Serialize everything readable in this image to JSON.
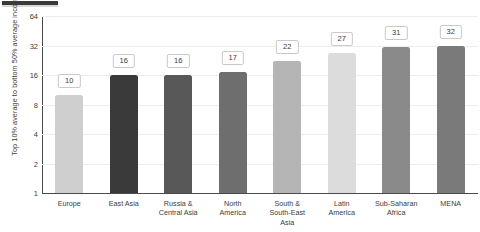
{
  "chart_data": {
    "type": "bar",
    "title": "",
    "subtitle": "",
    "xlabel": "",
    "ylabel": "Top 10% average to bottom 50% average income ratio",
    "categories": [
      "Europe",
      "East Asia",
      "Russia &\nCentral Asia",
      "North\nAmerica",
      "South &\nSouth-East\nAsia",
      "Latin\nAmerica",
      "Sub-Saharan\nAfrica",
      "MENA"
    ],
    "values": [
      10,
      16,
      16,
      17,
      22,
      27,
      31,
      32
    ],
    "value_labels": [
      "10",
      "16",
      "16",
      "17",
      "22",
      "27",
      "31",
      "32"
    ],
    "bar_colors": [
      "#cfcfcf",
      "#3a3a3a",
      "#585858",
      "#6e6e6e",
      "#b5b5b5",
      "#dcdcdc",
      "#8a8a8a",
      "#7a7a7a"
    ],
    "yscale": "log2",
    "ylim": [
      1,
      64
    ],
    "yticks": [
      1,
      2,
      4,
      8,
      16,
      32,
      64
    ],
    "ytick_labels": [
      "1",
      "2",
      "4",
      "8",
      "16",
      "32",
      "64"
    ],
    "grid": true,
    "grid_axis": "y",
    "legend": false,
    "legend_position": "none",
    "axis_color": "#4a4a4a",
    "grid_color": "#ededed",
    "label_box_border": "#c9c9c9",
    "background": "#ffffff"
  }
}
